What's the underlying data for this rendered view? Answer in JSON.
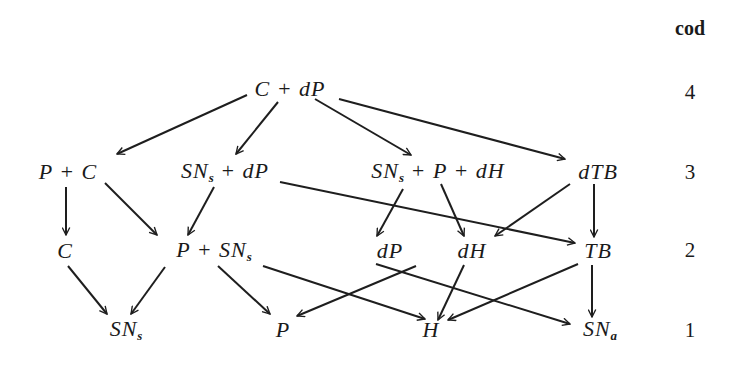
{
  "diagram": {
    "type": "directed-graph",
    "levels_label": "cod",
    "levels": [
      {
        "value": "4",
        "y": 92
      },
      {
        "value": "3",
        "y": 172
      },
      {
        "value": "2",
        "y": 250
      },
      {
        "value": "1",
        "y": 330
      }
    ],
    "nodes": [
      {
        "id": "C_dP",
        "main": "C + dP",
        "sub": "",
        "tail": "",
        "level": 4,
        "x": 290,
        "y": 89
      },
      {
        "id": "P_C",
        "main": "P + C",
        "sub": "",
        "tail": "",
        "level": 3,
        "x": 68,
        "y": 172
      },
      {
        "id": "SNs_dP",
        "main": "SN",
        "sub": "s",
        "tail": " + dP",
        "level": 3,
        "x": 225,
        "y": 172
      },
      {
        "id": "SNs_P_dH",
        "main": "SN",
        "sub": "s",
        "tail": " + P + dH",
        "level": 3,
        "x": 438,
        "y": 172
      },
      {
        "id": "dTB",
        "main": "dTB",
        "sub": "",
        "tail": "",
        "level": 3,
        "x": 598,
        "y": 172
      },
      {
        "id": "C",
        "main": "C",
        "sub": "",
        "tail": "",
        "level": 2,
        "x": 65,
        "y": 251
      },
      {
        "id": "P_SNs",
        "main": "P + SN",
        "sub": "s",
        "tail": "",
        "level": 2,
        "x": 214,
        "y": 251
      },
      {
        "id": "dP",
        "main": "dP",
        "sub": "",
        "tail": "",
        "level": 2,
        "x": 390,
        "y": 251
      },
      {
        "id": "dH",
        "main": "dH",
        "sub": "",
        "tail": "",
        "level": 2,
        "x": 472,
        "y": 251
      },
      {
        "id": "TB",
        "main": "TB",
        "sub": "",
        "tail": "",
        "level": 2,
        "x": 598,
        "y": 251
      },
      {
        "id": "SNs",
        "main": "SN",
        "sub": "s",
        "tail": "",
        "level": 1,
        "x": 126,
        "y": 330
      },
      {
        "id": "P",
        "main": "P",
        "sub": "",
        "tail": "",
        "level": 1,
        "x": 283,
        "y": 330
      },
      {
        "id": "H",
        "main": "H",
        "sub": "",
        "tail": "",
        "level": 1,
        "x": 431,
        "y": 330
      },
      {
        "id": "SNa",
        "main": "SN",
        "sub": "a",
        "tail": "",
        "level": 1,
        "x": 600,
        "y": 330
      }
    ],
    "edges": [
      {
        "from": "C_dP",
        "to": "P_C",
        "x1": 247,
        "y1": 95,
        "x2": 117,
        "y2": 154
      },
      {
        "from": "C_dP",
        "to": "SNs_dP",
        "x1": 278,
        "y1": 102,
        "x2": 236,
        "y2": 154
      },
      {
        "from": "C_dP",
        "to": "SNs_P_dH",
        "x1": 315,
        "y1": 99,
        "x2": 411,
        "y2": 155
      },
      {
        "from": "C_dP",
        "to": "dTB",
        "x1": 339,
        "y1": 99,
        "x2": 565,
        "y2": 159
      },
      {
        "from": "P_C",
        "to": "C",
        "x1": 66,
        "y1": 187,
        "x2": 66,
        "y2": 235
      },
      {
        "from": "P_C",
        "to": "P_SNs",
        "x1": 105,
        "y1": 183,
        "x2": 157,
        "y2": 235
      },
      {
        "from": "SNs_dP",
        "to": "P_SNs",
        "x1": 214,
        "y1": 187,
        "x2": 188,
        "y2": 235
      },
      {
        "from": "SNs_dP",
        "to": "TB",
        "x1": 280,
        "y1": 182,
        "x2": 575,
        "y2": 243
      },
      {
        "from": "SNs_P_dH",
        "to": "dP",
        "x1": 403,
        "y1": 189,
        "x2": 377,
        "y2": 236
      },
      {
        "from": "SNs_P_dH",
        "to": "dH",
        "x1": 441,
        "y1": 184,
        "x2": 464,
        "y2": 236
      },
      {
        "from": "dTB",
        "to": "dH",
        "x1": 570,
        "y1": 184,
        "x2": 495,
        "y2": 236
      },
      {
        "from": "dTB",
        "to": "TB",
        "x1": 594,
        "y1": 184,
        "x2": 594,
        "y2": 237
      },
      {
        "from": "C",
        "to": "SNs",
        "x1": 68,
        "y1": 266,
        "x2": 107,
        "y2": 314
      },
      {
        "from": "P_SNs",
        "to": "SNs",
        "x1": 165,
        "y1": 267,
        "x2": 131,
        "y2": 314
      },
      {
        "from": "P_SNs",
        "to": "P",
        "x1": 218,
        "y1": 266,
        "x2": 270,
        "y2": 314
      },
      {
        "from": "P_SNs",
        "to": "H",
        "x1": 263,
        "y1": 266,
        "x2": 425,
        "y2": 319
      },
      {
        "from": "dP",
        "to": "P",
        "x1": 416,
        "y1": 266,
        "x2": 297,
        "y2": 316
      },
      {
        "from": "dP",
        "to": "SNa",
        "x1": 376,
        "y1": 264,
        "x2": 570,
        "y2": 324
      },
      {
        "from": "dH",
        "to": "H",
        "x1": 464,
        "y1": 265,
        "x2": 438,
        "y2": 320
      },
      {
        "from": "TB",
        "to": "H",
        "x1": 578,
        "y1": 264,
        "x2": 448,
        "y2": 320
      },
      {
        "from": "TB",
        "to": "SNa",
        "x1": 592,
        "y1": 265,
        "x2": 592,
        "y2": 317
      }
    ]
  }
}
